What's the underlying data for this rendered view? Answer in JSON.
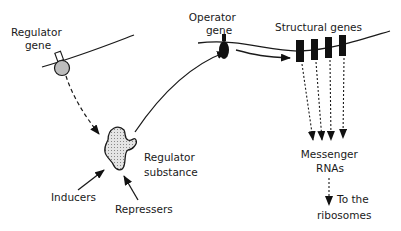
{
  "diagram": {
    "labels": {
      "regulator_gene": [
        "Regulator",
        "gene"
      ],
      "operator_gene": [
        "Operator",
        "gene"
      ],
      "structural_genes": "Structural genes",
      "regulator_substance": [
        "Regulator",
        "substance"
      ],
      "inducers": "Inducers",
      "repressers": "Repressers",
      "messenger_rnas": [
        "Messenger",
        "RNAs"
      ],
      "ribosomes": [
        "To the",
        "ribosomes"
      ]
    },
    "structural_gene_count": 4,
    "colors": {
      "ink": "#1a1a1a",
      "regulator_gene_fill": "#bdbdbd",
      "substance_fill": "#d6d6d6"
    }
  }
}
